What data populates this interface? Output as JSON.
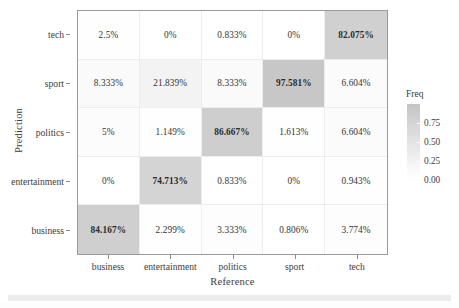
{
  "chart_data": {
    "type": "heatmap",
    "title": "",
    "xlabel": "Reference",
    "ylabel": "Prediction",
    "categories_x": [
      "business",
      "entertainment",
      "politics",
      "sport",
      "tech"
    ],
    "categories_y": [
      "tech",
      "sport",
      "politics",
      "entertainment",
      "business"
    ],
    "legend": {
      "title": "Freq",
      "position": "right",
      "ticks": [
        "0.75",
        "0.50",
        "0.25",
        "0.00"
      ],
      "tick_values": [
        0.75,
        0.5,
        0.25,
        0.0
      ],
      "range": [
        0.0,
        1.0
      ],
      "color_low": "#ffffff",
      "color_high": "#b4b4b4"
    },
    "grid": true,
    "rows": [
      {
        "label": "tech",
        "cells": [
          {
            "text": "2.5%",
            "value": 0.025,
            "highlight": false
          },
          {
            "text": "0%",
            "value": 0.0,
            "highlight": false
          },
          {
            "text": "0.833%",
            "value": 0.00833,
            "highlight": false
          },
          {
            "text": "0%",
            "value": 0.0,
            "highlight": false
          },
          {
            "text": "82.075%",
            "value": 0.82075,
            "highlight": true
          }
        ]
      },
      {
        "label": "sport",
        "cells": [
          {
            "text": "8.333%",
            "value": 0.08333,
            "highlight": false
          },
          {
            "text": "21.839%",
            "value": 0.21839,
            "highlight": false
          },
          {
            "text": "8.333%",
            "value": 0.08333,
            "highlight": false
          },
          {
            "text": "97.581%",
            "value": 0.97581,
            "highlight": true
          },
          {
            "text": "6.604%",
            "value": 0.06604,
            "highlight": false
          }
        ]
      },
      {
        "label": "politics",
        "cells": [
          {
            "text": "5%",
            "value": 0.05,
            "highlight": false
          },
          {
            "text": "1.149%",
            "value": 0.01149,
            "highlight": false
          },
          {
            "text": "86.667%",
            "value": 0.86667,
            "highlight": true
          },
          {
            "text": "1.613%",
            "value": 0.01613,
            "highlight": false
          },
          {
            "text": "6.604%",
            "value": 0.06604,
            "highlight": false
          }
        ]
      },
      {
        "label": "entertainment",
        "cells": [
          {
            "text": "0%",
            "value": 0.0,
            "highlight": false
          },
          {
            "text": "74.713%",
            "value": 0.74713,
            "highlight": true
          },
          {
            "text": "0.833%",
            "value": 0.00833,
            "highlight": false
          },
          {
            "text": "0%",
            "value": 0.0,
            "highlight": false
          },
          {
            "text": "0.943%",
            "value": 0.00943,
            "highlight": false
          }
        ]
      },
      {
        "label": "business",
        "cells": [
          {
            "text": "84.167%",
            "value": 0.84167,
            "highlight": true
          },
          {
            "text": "2.299%",
            "value": 0.02299,
            "highlight": false
          },
          {
            "text": "3.333%",
            "value": 0.03333,
            "highlight": false
          },
          {
            "text": "0.806%",
            "value": 0.00806,
            "highlight": false
          },
          {
            "text": "3.774%",
            "value": 0.03774,
            "highlight": false
          }
        ]
      }
    ]
  }
}
